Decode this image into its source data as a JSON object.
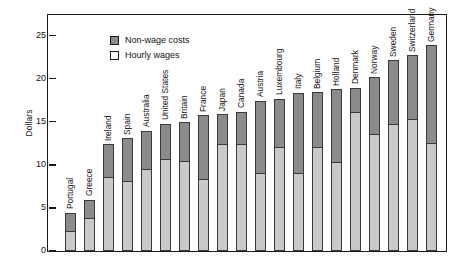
{
  "chart_data": {
    "type": "bar",
    "subtype": "stacked",
    "title": "",
    "xlabel": "",
    "ylabel": "Dollars",
    "ylim": [
      0,
      27.5
    ],
    "yticks": [
      0,
      5,
      10,
      15,
      20,
      25
    ],
    "ytick_labels": [
      "0",
      "5",
      "10",
      "15",
      "20",
      "25"
    ],
    "grid": false,
    "legend_position": "top-left",
    "legend": [
      "Non-wage costs",
      "Hourly wages"
    ],
    "categories": [
      "Portugal",
      "Greece",
      "Ireland",
      "Spain",
      "Australia",
      "United States",
      "Britain",
      "France",
      "Japan",
      "Canada",
      "Austria",
      "Luxembourg",
      "Italy",
      "Belgium",
      "Holland",
      "Denmark",
      "Norway",
      "Sweden",
      "Switzerland",
      "Germany"
    ],
    "series": [
      {
        "name": "Hourly wages",
        "color": "#c9c9c9",
        "values": [
          2.2,
          3.8,
          8.5,
          8.1,
          9.4,
          10.6,
          10.4,
          8.3,
          12.3,
          12.3,
          9.0,
          12.0,
          9.0,
          12.0,
          10.2,
          16.0,
          13.5,
          14.7,
          15.2,
          12.5
        ]
      },
      {
        "name": "Non-wage costs",
        "color": "#8b8b8b",
        "values": [
          2.3,
          2.2,
          3.9,
          5.0,
          4.6,
          4.2,
          4.6,
          7.5,
          3.6,
          3.9,
          8.5,
          5.7,
          9.4,
          6.5,
          8.6,
          3.0,
          6.7,
          7.5,
          7.6,
          11.4
        ]
      }
    ],
    "totals": [
      4.5,
      6.0,
      12.4,
      13.1,
      14.0,
      14.8,
      15.0,
      15.8,
      15.9,
      16.2,
      17.5,
      17.7,
      18.4,
      18.5,
      18.8,
      19.0,
      20.2,
      22.2,
      22.8,
      23.9
    ]
  },
  "colors": {
    "non_wage": "#8b8b8b",
    "wages": "#c9c9c9",
    "axis": "#1a1a1a",
    "background": "#ffffff"
  }
}
